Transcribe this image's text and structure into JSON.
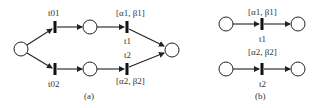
{
  "diagram": {
    "type": "petri-net",
    "panel_a": {
      "caption": "(a)",
      "transitions": {
        "t01": "t01",
        "t02": "t02",
        "t1": "t1",
        "t2": "t2"
      },
      "intervals": {
        "upper": "[α1, β1]",
        "lower": "[α2, β2]"
      }
    },
    "panel_b": {
      "caption": "(b)",
      "transitions": {
        "t1": "t1",
        "t2": "t2"
      },
      "intervals": {
        "upper": "[α1, β1]",
        "lower": "[α2, β2]"
      }
    },
    "colors": {
      "stroke": "#222222",
      "transition": "#111111"
    }
  }
}
